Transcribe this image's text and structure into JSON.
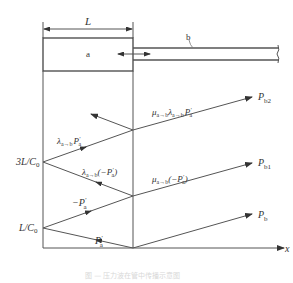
{
  "diagram": {
    "dimension_label": "L",
    "region_a_label": "a",
    "pipe_b_label": "b",
    "x_axis_label": "x",
    "time_labels": {
      "t1": {
        "main": "L/C",
        "sub": "0"
      },
      "t3": {
        "main": "3L/C",
        "sub": "0"
      }
    },
    "wave_labels": {
      "incident": {
        "main": "P",
        "prime": "′",
        "sub": "a"
      },
      "first_reflect": {
        "pre": "−P",
        "prime": "′",
        "sub": "a"
      },
      "second_reflect": {
        "lambda": "λ",
        "lsub": "a→b",
        "post": "(−P",
        "prime": "′",
        "sub": "a",
        "close": ")"
      },
      "third_reflect": {
        "lambda": "λ",
        "lsub": "a→b",
        "main": "P",
        "prime": "′",
        "sub": "a"
      },
      "trans1": {
        "mu": "μ",
        "musub": "a→b",
        "post": "(−P",
        "prime": "′",
        "sub": "a",
        "close": ")"
      },
      "trans2": {
        "mu": "μ",
        "musub": "a→b",
        "lambda": "λ",
        "lsub": "a→b",
        "main": "P",
        "prime": "′",
        "sub": "a"
      }
    },
    "output_labels": {
      "pb": {
        "main": "P",
        "sub": "b"
      },
      "pb1": {
        "main": "P",
        "sub": "b1"
      },
      "pb2": {
        "main": "P",
        "sub": "b2"
      }
    },
    "caption": "图 — 压力波在管中传播示意图",
    "line_color": "#444444"
  }
}
